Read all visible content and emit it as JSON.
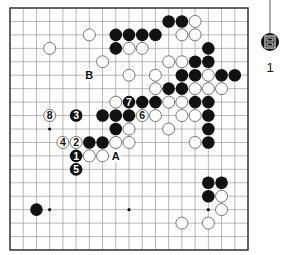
{
  "diagram": {
    "type": "go-board",
    "size": 19,
    "colors": {
      "background": "#ffffff",
      "grid": "#9a9a9a",
      "frame": "#333333",
      "black_stone": "#111111",
      "white_stone": "#ffffff",
      "white_stone_edge": "#555555",
      "label": "#111111"
    },
    "star_points": [
      [
        3,
        9
      ],
      [
        3,
        15
      ],
      [
        9,
        15
      ],
      [
        15,
        15
      ]
    ],
    "black_stones": [
      [
        12,
        1
      ],
      [
        13,
        1
      ],
      [
        8,
        2
      ],
      [
        9,
        2
      ],
      [
        10,
        2
      ],
      [
        11,
        2
      ],
      [
        8,
        3
      ],
      [
        15,
        3
      ],
      [
        14,
        4
      ],
      [
        15,
        4
      ],
      [
        13,
        5
      ],
      [
        14,
        5
      ],
      [
        16,
        5
      ],
      [
        17,
        5
      ],
      [
        12,
        6
      ],
      [
        13,
        6
      ],
      [
        10,
        7
      ],
      [
        11,
        7
      ],
      [
        14,
        7
      ],
      [
        15,
        7
      ],
      [
        7,
        8
      ],
      [
        8,
        8
      ],
      [
        9,
        8
      ],
      [
        15,
        8
      ],
      [
        8,
        9
      ],
      [
        15,
        9
      ],
      [
        6,
        10
      ],
      [
        7,
        10
      ],
      [
        15,
        10
      ],
      [
        15,
        13
      ],
      [
        16,
        13
      ],
      [
        15,
        14
      ],
      [
        2,
        15
      ]
    ],
    "white_stones": [
      [
        14,
        1
      ],
      [
        6,
        2
      ],
      [
        13,
        2
      ],
      [
        14,
        2
      ],
      [
        3,
        3
      ],
      [
        9,
        3
      ],
      [
        10,
        3
      ],
      [
        7,
        4
      ],
      [
        12,
        4
      ],
      [
        13,
        4
      ],
      [
        9,
        5
      ],
      [
        11,
        5
      ],
      [
        15,
        5
      ],
      [
        11,
        6
      ],
      [
        14,
        6
      ],
      [
        15,
        6
      ],
      [
        16,
        6
      ],
      [
        8,
        7
      ],
      [
        12,
        7
      ],
      [
        13,
        7
      ],
      [
        11,
        8
      ],
      [
        13,
        8
      ],
      [
        14,
        8
      ],
      [
        9,
        9
      ],
      [
        12,
        9
      ],
      [
        8,
        10
      ],
      [
        9,
        10
      ],
      [
        14,
        10
      ],
      [
        6,
        11
      ],
      [
        7,
        11
      ],
      [
        16,
        14
      ],
      [
        16,
        15
      ],
      [
        13,
        16
      ],
      [
        15,
        16
      ]
    ],
    "numbered_moves": [
      {
        "number": "1",
        "color": "black",
        "col": 5,
        "row": 11
      },
      {
        "number": "2",
        "color": "white",
        "col": 5,
        "row": 10
      },
      {
        "number": "3",
        "color": "black",
        "col": 5,
        "row": 8
      },
      {
        "number": "4",
        "color": "white",
        "col": 4,
        "row": 10
      },
      {
        "number": "5",
        "color": "black",
        "col": 5,
        "row": 12
      },
      {
        "number": "6",
        "color": "white",
        "col": 10,
        "row": 8
      },
      {
        "number": "7",
        "color": "black",
        "col": 9,
        "row": 7
      },
      {
        "number": "8",
        "color": "white",
        "col": 3,
        "row": 8
      }
    ],
    "letter_labels": [
      {
        "text": "A",
        "col": 8,
        "row": 11
      },
      {
        "text": "B",
        "col": 6,
        "row": 5
      }
    ]
  },
  "side_marker": {
    "icon": "book-icon",
    "label": "1"
  }
}
